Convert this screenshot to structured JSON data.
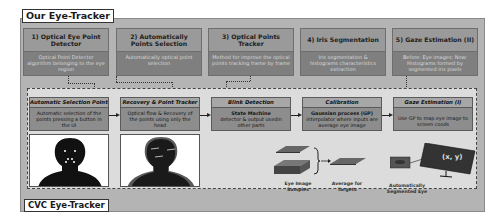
{
  "diagram": {
    "top_section_title": "Our Eye-Tracker",
    "bottom_section_title": "CVC Eye-Tracker",
    "top_steps": [
      {
        "title": "1) Optical Eye Point Detector",
        "description": "Optical Point Detector algorithm belonging to the eye region"
      },
      {
        "title": "2) Automatically Points Selection",
        "description": "Automatically optical point selection"
      },
      {
        "title": "3) Optical Points Tracker",
        "description": "Method for improve the optical points tracking frame by frame"
      },
      {
        "title": "4) Iris Segmentation",
        "description": "Iris segmentation & histograms characteristics extraction"
      },
      {
        "title": "5) Gaze Estimation (II)",
        "description": "Before: Eye images; Now: Histograms formed by segmented iris pixels"
      }
    ],
    "cvc_steps": [
      {
        "title": "Automatic Selection Points",
        "description": "Automatic selection of the points pressing a button in the UI"
      },
      {
        "title": "Recovery & Point Tracker",
        "description": "Optical flow & Recovery of the points using only the head"
      },
      {
        "title": "Blink Detection",
        "description_bold": "State Machine",
        "description": "detector & output usedin other parts"
      },
      {
        "title": "Calibration",
        "description_bold": "Gaussian process (GP)",
        "description": "interpolator where inputs are average eye image"
      },
      {
        "title": "Gaze Estimation (I)",
        "description": "Use GP to map eye image to screen coods"
      }
    ],
    "captions": {
      "eye_samples": "Eye Image Samples",
      "average": "Average for Targets",
      "segmented_eye": "Automatically Segmented Eye",
      "screen_coords": "(x, y)"
    }
  }
}
